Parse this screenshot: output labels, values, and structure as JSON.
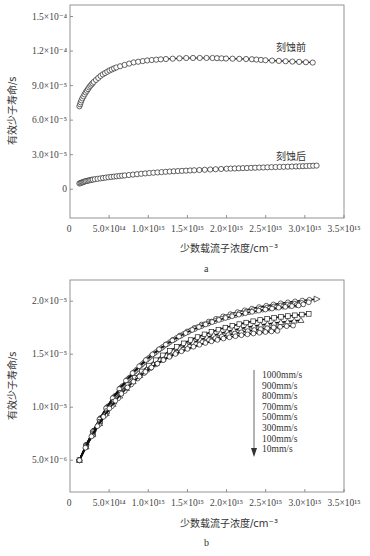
{
  "chart_data": [
    {
      "panel": "a",
      "type": "scatter",
      "title": "",
      "xlabel": "少数载流子浓度/cm⁻³",
      "ylabel": "有效少子寿命/s",
      "xlim": [
        0,
        3500000000000000.0
      ],
      "ylim": [
        -2.5e-05,
        0.00016
      ],
      "x_ticks": [
        0,
        500000000000000.0,
        1000000000000000.0,
        1500000000000000.0,
        2000000000000000.0,
        2500000000000000.0,
        3000000000000000.0,
        3500000000000000.0
      ],
      "x_tick_labels": [
        "0",
        "5.0×10¹⁴",
        "1.0×10¹⁵",
        "1.5×10¹⁵",
        "2.0×10¹⁵",
        "2.5×10¹⁵",
        "3.0×10¹⁵",
        "3.5×10¹⁵"
      ],
      "y_ticks": [
        0,
        3e-05,
        6e-05,
        9e-05,
        0.00012,
        0.00015
      ],
      "y_tick_labels": [
        "0",
        "3.0×10⁻⁵",
        "6.0×10⁻⁵",
        "9.0×10⁻⁵",
        "1.2×10⁻⁴",
        "1.5×10⁻⁴"
      ],
      "grid": false,
      "series": [
        {
          "name": "刻蚀前",
          "marker": "open-circle",
          "x": [
            120000000000000.0,
            150000000000000.0,
            200000000000000.0,
            250000000000000.0,
            300000000000000.0,
            400000000000000.0,
            500000000000000.0,
            600000000000000.0,
            800000000000000.0,
            1000000000000000.0,
            1200000000000000.0,
            1500000000000000.0,
            1800000000000000.0,
            2000000000000000.0,
            2300000000000000.0,
            2500000000000000.0,
            2800000000000000.0,
            3100000000000000.0
          ],
          "y": [
            7.2e-05,
            7.8e-05,
            8.4e-05,
            8.9e-05,
            9.3e-05,
            9.9e-05,
            0.000103,
            0.000106,
            0.00011,
            0.000112,
            0.000113,
            0.000114,
            0.000114,
            0.0001135,
            0.000113,
            0.000112,
            0.000111,
            0.00011
          ]
        },
        {
          "name": "刻蚀后",
          "marker": "open-circle",
          "x": [
            120000000000000.0,
            200000000000000.0,
            300000000000000.0,
            500000000000000.0,
            700000000000000.0,
            1000000000000000.0,
            1300000000000000.0,
            1600000000000000.0,
            2000000000000000.0,
            2300000000000000.0,
            2600000000000000.0,
            2900000000000000.0,
            3150000000000000.0
          ],
          "y": [
            5e-06,
            7e-06,
            8.5e-06,
            1.05e-05,
            1.2e-05,
            1.4e-05,
            1.55e-05,
            1.65e-05,
            1.78e-05,
            1.85e-05,
            1.92e-05,
            1.98e-05,
            2.05e-05
          ]
        }
      ],
      "annotations": [
        "刻蚀前",
        "刻蚀后"
      ],
      "panel_label": "a"
    },
    {
      "panel": "b",
      "type": "scatter",
      "title": "",
      "xlabel": "少数载流子浓度/cm⁻³",
      "ylabel": "有效少子寿命/s",
      "xlim": [
        0,
        3500000000000000.0
      ],
      "ylim": [
        2e-06,
        2.2e-05
      ],
      "x_ticks": [
        0,
        500000000000000.0,
        1000000000000000.0,
        1500000000000000.0,
        2000000000000000.0,
        2500000000000000.0,
        3000000000000000.0,
        3500000000000000.0
      ],
      "x_tick_labels": [
        "0",
        "5.0×10¹⁴",
        "1.0×10¹⁵",
        "1.5×10¹⁵",
        "2.0×10¹⁵",
        "2.5×10¹⁵",
        "3.0×10¹⁵",
        "3.5×10¹⁵"
      ],
      "y_ticks": [
        5e-06,
        1e-05,
        1.5e-05,
        2e-05
      ],
      "y_tick_labels": [
        "5.0×10⁻⁶",
        "1.0×10⁻⁵",
        "1.5×10⁻⁵",
        "2.0×10⁻⁵"
      ],
      "grid": false,
      "legend": {
        "position": "lower right, with downward arrow",
        "entries": [
          "1000mm/s",
          "900mm/s",
          "800mm/s",
          "700mm/s",
          "500mm/s",
          "300mm/s",
          "100mm/s",
          "10mm/s"
        ]
      },
      "series": [
        {
          "name": "1000mm/s",
          "marker": "triangle-right",
          "x_end": 3150000000000000.0,
          "y_end": 2.02e-05
        },
        {
          "name": "900mm/s",
          "marker": "circle",
          "x_end": 3050000000000000.0,
          "y_end": 1.99e-05
        },
        {
          "name": "800mm/s",
          "marker": "circle",
          "x_end": 2980000000000000.0,
          "y_end": 1.97e-05
        },
        {
          "name": "700mm/s",
          "marker": "circle",
          "x_end": 2920000000000000.0,
          "y_end": 1.96e-05
        },
        {
          "name": "500mm/s",
          "marker": "square",
          "x_end": 3050000000000000.0,
          "y_end": 1.88e-05
        },
        {
          "name": "300mm/s",
          "marker": "triangle",
          "x_end": 2950000000000000.0,
          "y_end": 1.82e-05
        },
        {
          "name": "100mm/s",
          "marker": "circle",
          "x_end": 2850000000000000.0,
          "y_end": 1.77e-05
        },
        {
          "name": "10mm/s",
          "marker": "circle",
          "x_end": 2650000000000000.0,
          "y_end": 1.72e-05
        }
      ],
      "series_start": {
        "x": 120000000000000.0,
        "y": 5e-06
      },
      "panel_label": "b"
    }
  ],
  "text": {
    "a": {
      "ylabel": "有效少子寿命/s",
      "xlabel": "少数载流子浓度/cm⁻³",
      "annot_before": "刻蚀前",
      "annot_after": "刻蚀后",
      "panel_label": "a",
      "xticks": [
        "0",
        "5.0×10¹⁴",
        "1.0×10¹⁵",
        "1.5×10¹⁵",
        "2.0×10¹⁵",
        "2.5×10¹⁵",
        "3.0×10¹⁵",
        "3.5×10¹⁵"
      ],
      "yticks": [
        "0",
        "3.0×10⁻⁵",
        "6.0×10⁻⁵",
        "9.0×10⁻⁵",
        "1.2×10⁻⁴",
        "1.5×10⁻⁴"
      ]
    },
    "b": {
      "ylabel": "有效少子寿命/s",
      "xlabel": "少数载流子浓度/cm⁻³",
      "panel_label": "b",
      "xticks": [
        "0",
        "5.0×10¹⁴",
        "1.0×10¹⁵",
        "1.5×10¹⁵",
        "2.0×10¹⁵",
        "2.5×10¹⁵",
        "3.0×10¹⁵",
        "3.5×10¹⁵"
      ],
      "yticks": [
        "5.0×10⁻⁶",
        "1.0×10⁻⁵",
        "1.5×10⁻⁵",
        "2.0×10⁻⁵"
      ],
      "legend": [
        "1000mm/s",
        "900mm/s",
        "800mm/s",
        "700mm/s",
        "500mm/s",
        "300mm/s",
        "100mm/s",
        "10mm/s"
      ]
    }
  }
}
